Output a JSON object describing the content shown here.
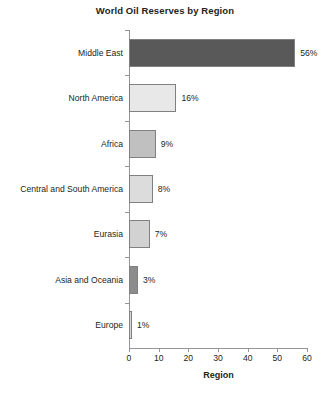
{
  "chart_data": {
    "type": "bar",
    "orientation": "horizontal",
    "title": "World Oil Reserves by Region",
    "xlabel": "Region",
    "ylabel": "",
    "xlim": [
      0,
      60
    ],
    "xticks": [
      0,
      10,
      20,
      30,
      40,
      50,
      60
    ],
    "grid": false,
    "legend": null,
    "categories": [
      "Middle East",
      "North America",
      "Africa",
      "Central and South America",
      "Eurasia",
      "Asia and Oceania",
      "Europe"
    ],
    "values": [
      56,
      16,
      9,
      8,
      7,
      3,
      1
    ],
    "data_labels": [
      "56%",
      "16%",
      "9%",
      "8%",
      "7%",
      "3%",
      "1%"
    ],
    "bar_colors": [
      "#595959",
      "#e8e8e8",
      "#c0c0c0",
      "#dcdcdc",
      "#d2d2d2",
      "#8c8c8c",
      "#d8d8d8"
    ],
    "bar_edge_color": "#808080",
    "axis_color": "#939598",
    "background": "#ffffff",
    "text_color": "#231f20"
  }
}
